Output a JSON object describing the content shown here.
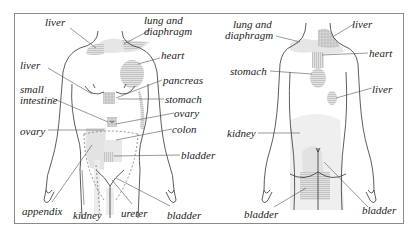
{
  "diagram": {
    "type": "referred-pain-body-map",
    "panels": [
      {
        "id": "front",
        "view": "front",
        "labels": [
          {
            "text": "liver",
            "x": 45,
            "y": 23
          },
          {
            "text": "lung and",
            "x": 144,
            "y": 19
          },
          {
            "text": "diaphragm",
            "x": 144,
            "y": 31
          },
          {
            "text": "heart",
            "x": 161,
            "y": 51
          },
          {
            "text": "liver",
            "x": 20,
            "y": 60
          },
          {
            "text": "pancreas",
            "x": 163,
            "y": 74
          },
          {
            "text": "small",
            "x": 20,
            "y": 84
          },
          {
            "text": "intestine",
            "x": 20,
            "y": 95
          },
          {
            "text": "stomach",
            "x": 165,
            "y": 94
          },
          {
            "text": "ovary",
            "x": 174,
            "y": 109
          },
          {
            "text": "ovary",
            "x": 20,
            "y": 126
          },
          {
            "text": "colon",
            "x": 172,
            "y": 125
          },
          {
            "text": "bladder",
            "x": 181,
            "y": 150
          },
          {
            "text": "appendix",
            "x": 22,
            "y": 206
          },
          {
            "text": "kidney",
            "x": 73,
            "y": 210
          },
          {
            "text": "ureter",
            "x": 121,
            "y": 209
          },
          {
            "text": "bladder",
            "x": 167,
            "y": 210
          }
        ]
      },
      {
        "id": "back",
        "view": "back",
        "labels": [
          {
            "text": "lung and",
            "x": 233,
            "y": 19
          },
          {
            "text": "diaphragm",
            "x": 225,
            "y": 31
          },
          {
            "text": "liver",
            "x": 352,
            "y": 19
          },
          {
            "text": "heart",
            "x": 369,
            "y": 47
          },
          {
            "text": "stomach",
            "x": 230,
            "y": 66
          },
          {
            "text": "liver",
            "x": 372,
            "y": 82
          },
          {
            "text": "kidney",
            "x": 227,
            "y": 128
          },
          {
            "text": "bladder",
            "x": 244,
            "y": 209
          },
          {
            "text": "bladder",
            "x": 362,
            "y": 203
          }
        ]
      }
    ]
  }
}
